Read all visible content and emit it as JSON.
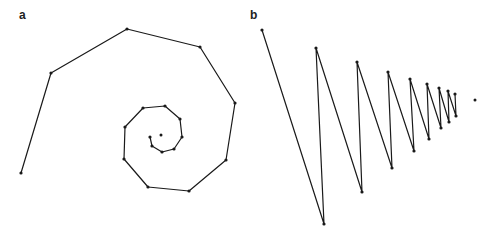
{
  "panels": [
    {
      "label": "a",
      "label_pos": [
        19,
        18
      ],
      "kind": "spiral",
      "line_color": "#1a1a1a",
      "points": [
        [
          21,
          173
        ],
        [
          51,
          73
        ],
        [
          127,
          29
        ],
        [
          200,
          47
        ],
        [
          235,
          103
        ],
        [
          226,
          160
        ],
        [
          189,
          191
        ],
        [
          148,
          187
        ],
        [
          124,
          159
        ],
        [
          125,
          127
        ],
        [
          143,
          108
        ],
        [
          165,
          106
        ],
        [
          180,
          119
        ],
        [
          182,
          137
        ],
        [
          174,
          149
        ],
        [
          162,
          152
        ],
        [
          152,
          146
        ],
        [
          150,
          137
        ]
      ],
      "center": [
        161,
        135
      ]
    },
    {
      "label": "b",
      "label_pos": [
        250,
        18
      ],
      "kind": "zigzag",
      "line_color": "#1a1a1a",
      "points": [
        [
          262,
          30
        ],
        [
          324,
          224
        ],
        [
          316,
          48
        ],
        [
          362,
          192
        ],
        [
          357,
          62
        ],
        [
          392,
          168
        ],
        [
          388,
          72
        ],
        [
          414,
          151
        ],
        [
          410,
          79
        ],
        [
          429,
          139
        ],
        [
          427,
          84
        ],
        [
          441,
          128
        ],
        [
          439,
          88
        ],
        [
          449,
          122
        ],
        [
          448,
          91
        ],
        [
          456,
          116
        ],
        [
          455,
          94
        ]
      ],
      "center": [
        475,
        100
      ]
    }
  ]
}
